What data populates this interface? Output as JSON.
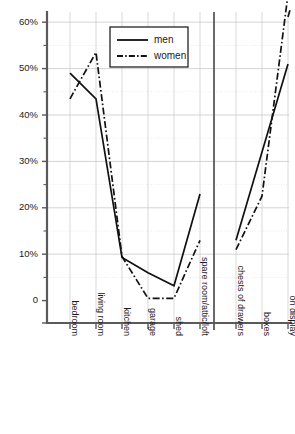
{
  "chart_data": {
    "type": "line",
    "title": "",
    "subtitle": "",
    "xlabel": "",
    "ylabel": "",
    "ylim": [
      0,
      65
    ],
    "grid": true,
    "legend_position": "top-center",
    "panels": [
      {
        "name": "location",
        "categories": [
          "bedroom",
          "living room",
          "kitchen",
          "garage",
          "shed",
          "spare room/attic/loft"
        ]
      },
      {
        "name": "storage",
        "categories": [
          "chests of drawers",
          "boxes",
          "on display"
        ]
      }
    ],
    "categories": [
      "bedroom",
      "living room",
      "kitchen",
      "garage",
      "shed",
      "spare room/attic/loft",
      "chests of drawers",
      "boxes",
      "on display"
    ],
    "ytick_labels": [
      "0",
      "10%",
      "20%",
      "30%",
      "40%",
      "50%",
      "60%"
    ],
    "ytick_values": [
      0,
      10,
      20,
      30,
      40,
      50,
      60
    ],
    "yminor_values": [
      5,
      15,
      25,
      35,
      45,
      55
    ],
    "series": [
      {
        "name": "men",
        "style": "solid",
        "color": "#111111",
        "values": [
          49,
          43.5,
          9.3,
          6,
          3.2,
          23,
          13,
          32,
          51
        ]
      },
      {
        "name": "women",
        "style": "dash-dot",
        "color": "#111111",
        "values": [
          43.5,
          53.5,
          9.5,
          0.5,
          0.5,
          13,
          11,
          22.5,
          66
        ]
      }
    ]
  },
  "legend": {
    "entries": [
      {
        "label": "men"
      },
      {
        "label": "women"
      }
    ]
  }
}
